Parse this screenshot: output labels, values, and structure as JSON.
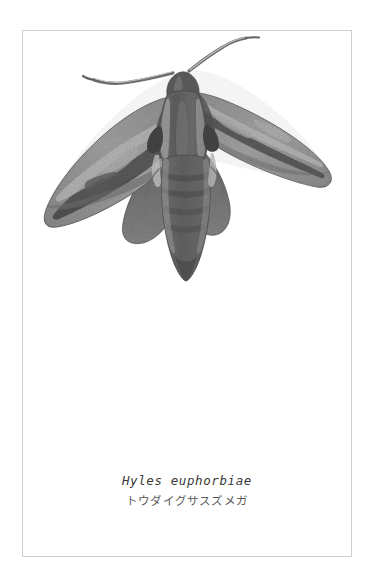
{
  "page": {
    "background_color": "#ffffff",
    "border_color": "#cfcfcf"
  },
  "plate": {
    "subject": "moth-specimen",
    "icon_name": "hawk-moth-illustration",
    "style": "grayscale-stipple-engraving",
    "orientation": "dorsal-wings-spread",
    "palette": {
      "darkest": "#3b3b3b",
      "dark": "#5c5c5c",
      "mid": "#7d7d7d",
      "light": "#9d9d9d",
      "lightest": "#b9b9b9",
      "highlight": "#d6d6d6"
    },
    "parts": [
      "left-antenna",
      "right-antenna",
      "head",
      "thorax",
      "abdomen",
      "left-forewing",
      "right-forewing",
      "left-hindwing",
      "right-hindwing"
    ]
  },
  "caption": {
    "scientific_name": "Hyles euphorbiae",
    "common_name": "トウダイグサスズメガ",
    "scientific_name_color": "#3a3a3a",
    "common_name_color": "#5a5a5a"
  }
}
